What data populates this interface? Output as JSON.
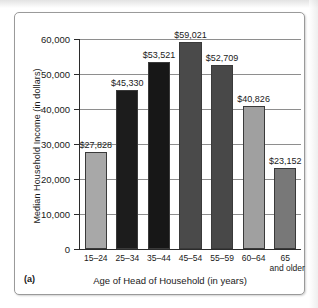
{
  "figure": {
    "label": "(a)"
  },
  "chart_data": {
    "type": "bar",
    "title": "",
    "xlabel": "Age of Head of Household (in years)",
    "ylabel": "Median Household Income (in dollars)",
    "categories": [
      "15–24",
      "25–34",
      "35–44",
      "45–54",
      "55–59",
      "60–64",
      "65"
    ],
    "category_sublabels": [
      "",
      "",
      "",
      "",
      "",
      "",
      "and older"
    ],
    "values": [
      27828,
      45330,
      53521,
      59021,
      52709,
      40826,
      23152
    ],
    "value_labels": [
      "$27,828",
      "$45,330",
      "$53,521",
      "$59,021",
      "$52,709",
      "$40,826",
      "$23,152"
    ],
    "ylim": [
      0,
      60000
    ],
    "ytick_values": [
      0,
      10000,
      20000,
      30000,
      40000,
      50000,
      60000
    ],
    "ytick_labels": [
      "0",
      "10,000",
      "20,000",
      "30,000",
      "40,000",
      "50,000",
      "60,000"
    ],
    "grid": true,
    "grid_axis": "y",
    "legend": "none",
    "bar_colors": [
      "#a8a8a8",
      "#1c1c1c",
      "#171717",
      "#4a4a4a",
      "#484848",
      "#a0a0a0",
      "#787878"
    ]
  }
}
